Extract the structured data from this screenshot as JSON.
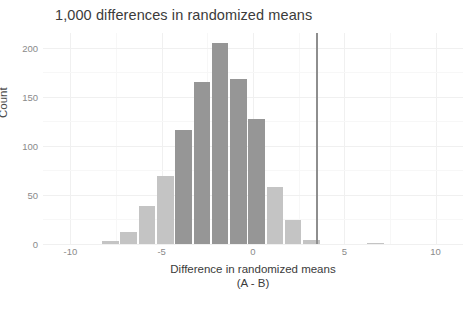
{
  "chart": {
    "title": "1,000 differences in randomized means",
    "xlabel_line1": "Difference in randomized means",
    "xlabel_line2": "(A - B)",
    "ylabel": "Count"
  },
  "chart_data": {
    "type": "bar",
    "title": "1,000 differences in randomized means",
    "xlabel": "Difference in randomized means (A - B)",
    "ylabel": "Count",
    "xlim": [
      -11.5,
      11.5
    ],
    "ylim": [
      0,
      215
    ],
    "grid": true,
    "legend": null,
    "bin_width": 1,
    "x_ticks": [
      -10,
      -5,
      0,
      5,
      10
    ],
    "y_ticks": [
      0,
      50,
      100,
      150,
      200
    ],
    "bins": [
      {
        "x_start": -8.3,
        "x_end": -7.3,
        "center": -7.8,
        "count": 3,
        "shade": "light"
      },
      {
        "x_start": -7.3,
        "x_end": -6.3,
        "center": -6.8,
        "count": 12,
        "shade": "light"
      },
      {
        "x_start": -6.3,
        "x_end": -5.3,
        "center": -5.8,
        "count": 39,
        "shade": "light"
      },
      {
        "x_start": -5.3,
        "x_end": -4.3,
        "center": -4.8,
        "count": 69,
        "shade": "light"
      },
      {
        "x_start": -4.3,
        "x_end": -3.3,
        "center": -3.8,
        "count": 116,
        "shade": "dark"
      },
      {
        "x_start": -3.3,
        "x_end": -2.3,
        "center": -2.8,
        "count": 165,
        "shade": "dark"
      },
      {
        "x_start": -2.3,
        "x_end": -1.3,
        "center": -1.8,
        "count": 205,
        "shade": "dark"
      },
      {
        "x_start": -1.3,
        "x_end": -0.3,
        "center": -0.8,
        "count": 168,
        "shade": "dark"
      },
      {
        "x_start": -0.3,
        "x_end": 0.7,
        "center": 0.2,
        "count": 127,
        "shade": "dark"
      },
      {
        "x_start": 0.7,
        "x_end": 1.7,
        "center": 1.2,
        "count": 58,
        "shade": "light"
      },
      {
        "x_start": 1.7,
        "x_end": 2.7,
        "center": 2.2,
        "count": 24,
        "shade": "light"
      },
      {
        "x_start": 2.7,
        "x_end": 3.7,
        "center": 3.2,
        "count": 4,
        "shade": "light"
      },
      {
        "x_start": 6.2,
        "x_end": 7.2,
        "center": 6.7,
        "count": 1,
        "shade": "light"
      }
    ],
    "reference_line": {
      "x": 3.5,
      "y_top": 215,
      "label": "observed difference"
    },
    "colors": {
      "bar_light": "#c4c4c4",
      "bar_dark": "#969696",
      "reference_line": "#8e8e8e",
      "grid_major": "#f0f0f0",
      "grid_minor": "#f7f7f7",
      "text": "#3b3b3b",
      "tick_text": "#8a8a8a",
      "background": "#ffffff"
    }
  }
}
